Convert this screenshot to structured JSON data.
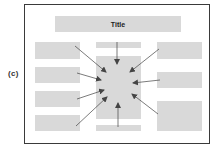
{
  "figure_label": "(c)",
  "title": "Title",
  "colors": {
    "frame": "#3a3a3a",
    "block": "#d9d9d9",
    "arrow": "#444444"
  },
  "layout": {
    "left_blocks": 4,
    "right_blocks": 3,
    "center": [
      "top-strip",
      "focal-block",
      "bottom-strip"
    ],
    "arrows_point_to": "focal-block",
    "arrow_count": 9
  }
}
